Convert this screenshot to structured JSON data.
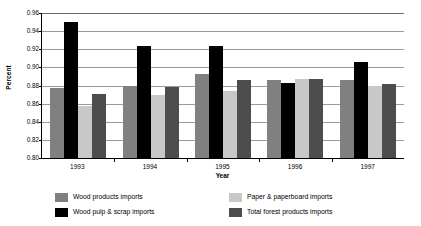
{
  "chart_data": {
    "type": "bar",
    "title": "",
    "subtitle": "",
    "xlabel": "Year",
    "ylabel": "Percent",
    "categories": [
      "1993",
      "1994",
      "1995",
      "1996",
      "1997"
    ],
    "ylim": [
      0.8,
      0.96
    ],
    "ytick_labels": [
      "0.96",
      "0.94",
      "0.92",
      "0.90",
      "0.88",
      "0.86",
      "0.84",
      "0.82",
      "0.80"
    ],
    "ytick_values": [
      0.96,
      0.94,
      0.92,
      0.9,
      0.88,
      0.86,
      0.84,
      0.82,
      0.8
    ],
    "grid": true,
    "legend_position": "bottom",
    "series": [
      {
        "name": "Wood products imports",
        "color": "#808080",
        "values": [
          0.877,
          0.88,
          0.893,
          0.886,
          0.886
        ]
      },
      {
        "name": "Wood pulp & scrap imports",
        "color": "#000000",
        "values": [
          0.95,
          0.924,
          0.924,
          0.883,
          0.906
        ]
      },
      {
        "name": "Paper & paperboard imports",
        "color": "#c8c8c8",
        "values": [
          0.857,
          0.87,
          0.874,
          0.887,
          0.879
        ]
      },
      {
        "name": "Total forest products imports",
        "color": "#4d4d4d",
        "values": [
          0.871,
          0.878,
          0.886,
          0.887,
          0.882
        ]
      }
    ]
  }
}
